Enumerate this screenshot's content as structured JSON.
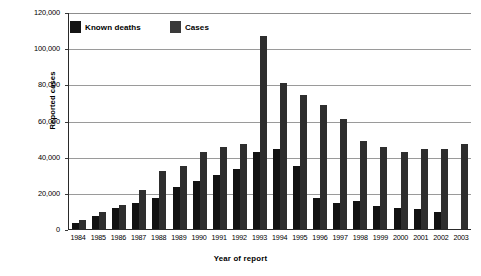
{
  "chart_data": {
    "type": "bar",
    "title": "",
    "xlabel": "Year of report",
    "ylabel": "Reported cases",
    "ylim": [
      0,
      120000
    ],
    "yticks": [
      0,
      20000,
      40000,
      60000,
      80000,
      100000,
      120000
    ],
    "ytick_labels": [
      "0",
      "20,000",
      "40,000",
      "60,000",
      "80,000",
      "100,000",
      "120,000"
    ],
    "grid": true,
    "legend_position": "top-left-inside",
    "categories": [
      "1984",
      "1985",
      "1986",
      "1987",
      "1988",
      "1989",
      "1990",
      "1991",
      "1992",
      "1993",
      "1994",
      "1995",
      "1996",
      "1997",
      "1998",
      "1999",
      "2000",
      "2001",
      "2002",
      "2003"
    ],
    "series": [
      {
        "name": "Known deaths",
        "color": "#121212",
        "values": [
          3500,
          7000,
          11500,
          14500,
          17000,
          23500,
          26500,
          30000,
          33000,
          42500,
          44000,
          35000,
          17000,
          14500,
          15500,
          13000,
          11500,
          11000,
          9500,
          null
        ]
      },
      {
        "name": "Cases",
        "color": "#2e2e2e",
        "values": [
          5000,
          9500,
          13500,
          21500,
          32000,
          35000,
          42500,
          45500,
          47000,
          107000,
          80500,
          74000,
          68500,
          61000,
          48500,
          45500,
          42500,
          44000,
          44500,
          47000
        ]
      }
    ]
  },
  "legend": {
    "items": [
      {
        "label": "Known deaths",
        "swatch": "black-square-icon"
      },
      {
        "label": "Cases",
        "swatch": "gray-square-icon"
      }
    ]
  },
  "axes": {
    "y_title": "Reported cases",
    "x_title": "Year of report"
  }
}
